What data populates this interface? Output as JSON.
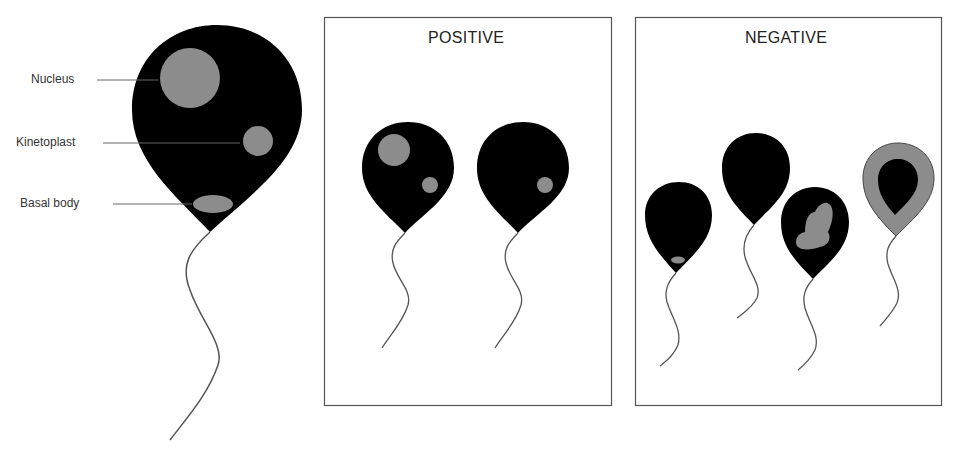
{
  "colors": {
    "cell_body": "#000000",
    "organelle": "#8c8c8c",
    "flagellum": "#555555",
    "panel_border": "#555555",
    "label_line": "#666666"
  },
  "reference_cell": {
    "labels": [
      {
        "text": "Nucleus",
        "target": "nucleus"
      },
      {
        "text": "Kinetoplast",
        "target": "kinetoplast"
      },
      {
        "text": "Basal body",
        "target": "basal-body"
      }
    ]
  },
  "panels": [
    {
      "title": "POSITIVE",
      "cells": [
        {
          "description": "cell with nucleus and kinetoplast"
        },
        {
          "description": "cell with kinetoplast only"
        }
      ]
    },
    {
      "title": "NEGATIVE",
      "cells": [
        {
          "description": "cell with basal body only"
        },
        {
          "description": "cell with no visible organelles"
        },
        {
          "description": "cell with irregular gray mass"
        },
        {
          "description": "cell with gray outer ring"
        }
      ]
    }
  ]
}
